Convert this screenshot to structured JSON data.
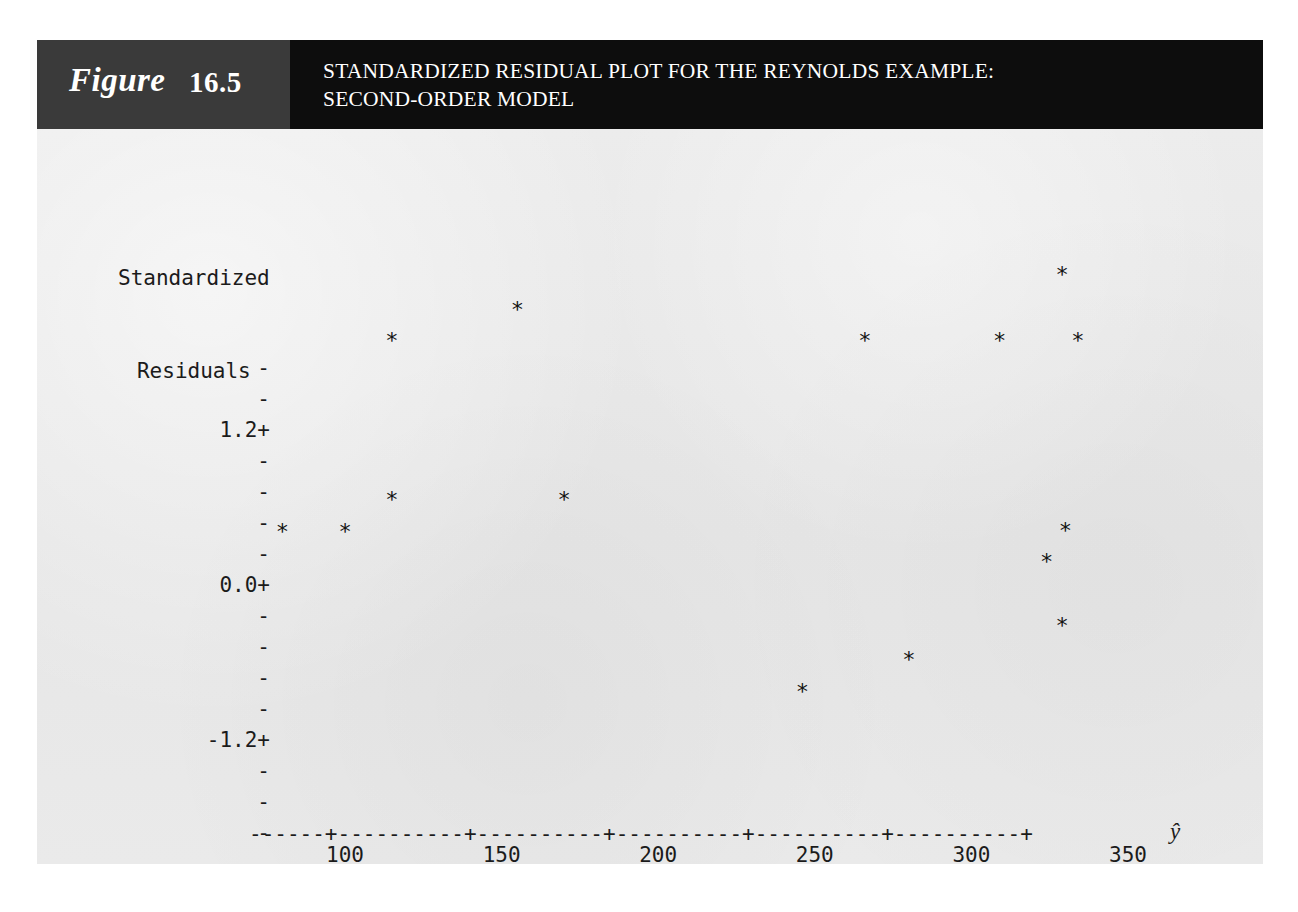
{
  "figure": {
    "word": "Figure",
    "number": "16.5",
    "title_line_1": "STANDARDIZED RESIDUAL PLOT FOR THE REYNOLDS EXAMPLE:",
    "title_line_2": "SECOND-ORDER MODEL",
    "band_color_left": "#3a3a3a",
    "band_color_right": "#0d0d0d",
    "panel_color": "#e9e9e9"
  },
  "chart_data": {
    "type": "scatter",
    "title": "STANDARDIZED RESIDUAL PLOT FOR THE REYNOLDS EXAMPLE: SECOND-ORDER MODEL",
    "ylabel_line_1": "Standardized",
    "ylabel_line_2": "Residuals",
    "xlabel": "ŷ",
    "marker": "*",
    "grid": false,
    "legend": null,
    "xlim": [
      70,
      365
    ],
    "ylim": [
      -2.0,
      1.75
    ],
    "x_ticks": [
      100,
      150,
      200,
      250,
      300,
      350
    ],
    "x_tick_labels": [
      "100",
      "150",
      "200",
      "250",
      "300",
      "350"
    ],
    "y_ticks": [
      1.2,
      0.0,
      -1.2
    ],
    "y_tick_labels": [
      "1.2+",
      "0.0+",
      "-1.2+"
    ],
    "y_minor_tick_label": "-",
    "axis_rule": "------+----------+----------+----------+----------+----------+",
    "y_axis_rows": [
      {
        "label": "-",
        "top": 229
      },
      {
        "label": "-",
        "top": 260
      },
      {
        "label": "1.2+",
        "top": 291
      },
      {
        "label": "-",
        "top": 322
      },
      {
        "label": "-",
        "top": 353
      },
      {
        "label": "-",
        "top": 384
      },
      {
        "label": "-",
        "top": 415
      },
      {
        "label": "0.0+",
        "top": 446
      },
      {
        "label": "-",
        "top": 477
      },
      {
        "label": "-",
        "top": 508
      },
      {
        "label": "-",
        "top": 539
      },
      {
        "label": "-",
        "top": 570
      },
      {
        "label": "-1.2+",
        "top": 601
      },
      {
        "label": "-",
        "top": 632
      },
      {
        "label": "-",
        "top": 663
      },
      {
        "label": "-",
        "top": 694
      },
      {
        "label": "-",
        "top": 725
      }
    ],
    "points": [
      {
        "x": 329,
        "y": 1.47
      },
      {
        "x": 155,
        "y": 1.2
      },
      {
        "x": 115,
        "y": 0.96
      },
      {
        "x": 266,
        "y": 0.96
      },
      {
        "x": 309,
        "y": 0.96
      },
      {
        "x": 334,
        "y": 0.96
      },
      {
        "x": 115,
        "y": -0.27
      },
      {
        "x": 170,
        "y": -0.27
      },
      {
        "x": 80,
        "y": -0.52
      },
      {
        "x": 100,
        "y": -0.52
      },
      {
        "x": 330,
        "y": -0.51
      },
      {
        "x": 324,
        "y": -0.75
      },
      {
        "x": 329,
        "y": -1.25
      },
      {
        "x": 280,
        "y": -1.51
      },
      {
        "x": 246,
        "y": -1.76
      }
    ]
  }
}
